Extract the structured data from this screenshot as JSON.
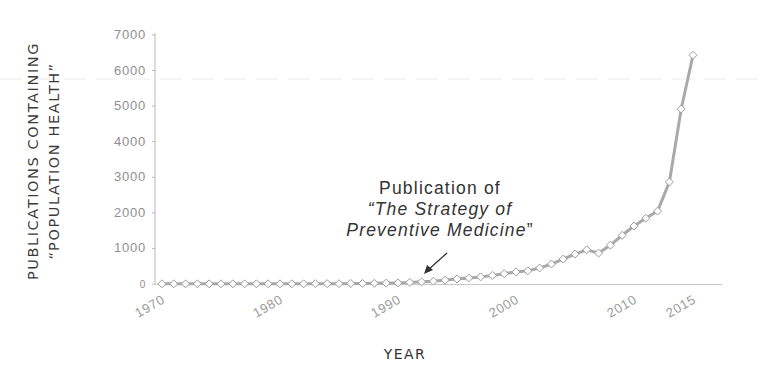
{
  "chart_data": {
    "type": "line",
    "title": "",
    "xlabel": "YEAR",
    "ylabel_line1": "PUBLICATIONS CONTAINING",
    "ylabel_line2": "“POPULATION HEALTH”",
    "ylim": [
      0,
      7000
    ],
    "xlim": [
      1970,
      2015
    ],
    "grid": false,
    "legend": null,
    "y_ticks": [
      0,
      1000,
      2000,
      3000,
      4000,
      5000,
      6000,
      7000
    ],
    "x_ticks": [
      1970,
      1980,
      1990,
      2000,
      2010,
      2015
    ],
    "series": [
      {
        "name": "Publications containing “population health”",
        "color": "#a9a9a9",
        "marker": "diamond-open",
        "x": [
          1970,
          1971,
          1972,
          1973,
          1974,
          1975,
          1976,
          1977,
          1978,
          1979,
          1980,
          1981,
          1982,
          1983,
          1984,
          1985,
          1986,
          1987,
          1988,
          1989,
          1990,
          1991,
          1992,
          1993,
          1994,
          1995,
          1996,
          1997,
          1998,
          1999,
          2000,
          2001,
          2002,
          2003,
          2004,
          2005,
          2006,
          2007,
          2008,
          2009,
          2010,
          2011,
          2012,
          2013,
          2014,
          2015
        ],
        "values": [
          5,
          5,
          5,
          5,
          5,
          5,
          5,
          5,
          5,
          5,
          5,
          5,
          5,
          10,
          10,
          10,
          15,
          15,
          20,
          25,
          30,
          45,
          60,
          80,
          110,
          140,
          170,
          200,
          240,
          290,
          340,
          370,
          450,
          560,
          700,
          840,
          960,
          870,
          1090,
          1370,
          1630,
          1850,
          2050,
          2870,
          4920,
          6430
        ]
      }
    ],
    "annotations": [
      {
        "line1": "Publication of",
        "line2": "“The Strategy of",
        "line3": "Preventive Medicine",
        "line3_close": "”",
        "points_to_year": 1992
      }
    ]
  }
}
